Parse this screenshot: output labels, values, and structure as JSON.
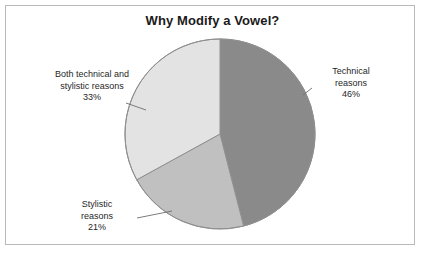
{
  "frame": {
    "border_color": "#b9b9b9",
    "background": "#ffffff"
  },
  "chart_data": {
    "type": "pie",
    "title": "Why Modify a Vowel?",
    "xlabel": "",
    "ylabel": "",
    "legend_position": "none",
    "grid": false,
    "start_angle_deg": 0,
    "direction": "clockwise",
    "categories": [
      "Technical reasons",
      "Stylistic reasons",
      "Both technical and stylistic reasons"
    ],
    "values": [
      46,
      21,
      33
    ],
    "value_unit": "percent",
    "colors": [
      "#8a8a8a",
      "#c0c0c0",
      "#e3e3e3"
    ],
    "slices": [
      {
        "name": "Technical reasons",
        "label_line1": "Technical",
        "label_line2": "reasons",
        "percent_label": "46%",
        "value": 46,
        "color": "#8a8a8a"
      },
      {
        "name": "Stylistic reasons",
        "label_line1": "Stylistic",
        "label_line2": "reasons",
        "percent_label": "21%",
        "value": 21,
        "color": "#c0c0c0"
      },
      {
        "name": "Both technical and stylistic reasons",
        "label_line1": "Both technical and",
        "label_line2": "stylistic reasons",
        "percent_label": "33%",
        "value": 33,
        "color": "#e3e3e3"
      }
    ]
  },
  "pie": {
    "center_x": 220,
    "center_y": 134,
    "radius": 95,
    "outline_color": "#8f8f8f",
    "leader_line_color": "#6e6e6e"
  }
}
